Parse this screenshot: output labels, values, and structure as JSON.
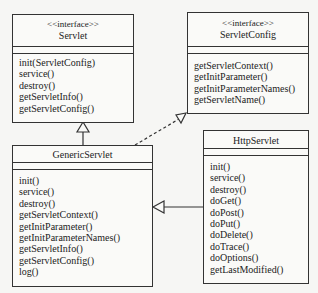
{
  "colors": {
    "stroke": "#333333",
    "background": "#f6f6f4",
    "box_fill": "#fafaf8"
  },
  "classes": {
    "servlet": {
      "stereotype": "<<interface>>",
      "name": "Servlet",
      "operations": [
        "init(ServletConfig)",
        "service()",
        "destroy()",
        "getServletInfo()",
        "getServletConfig()"
      ]
    },
    "servlet_config": {
      "stereotype": "<<interface>>",
      "name": "ServletConfig",
      "operations": [
        "getServletContext()",
        "getInitParameter()",
        "getInitParameterNames()",
        "getServletName()"
      ]
    },
    "generic_servlet": {
      "name": "GenericServlet",
      "operations": [
        "init()",
        "service()",
        "destroy()",
        "getServletContext()",
        "getInitParameter()",
        "getInitParameterNames()",
        "getServletInfo()",
        "getServletConfig()",
        "log()"
      ]
    },
    "http_servlet": {
      "name": "HttpServlet",
      "operations": [
        "init()",
        "service()",
        "destroy()",
        "doGet()",
        "doPost()",
        "doPut()",
        "doDelete()",
        "doTrace()",
        "doOptions()",
        "getLastModified()"
      ]
    }
  },
  "relationships": [
    {
      "from": "GenericServlet",
      "to": "Servlet",
      "type": "realization"
    },
    {
      "from": "GenericServlet",
      "to": "ServletConfig",
      "type": "realization-dashed"
    },
    {
      "from": "HttpServlet",
      "to": "GenericServlet",
      "type": "generalization"
    }
  ]
}
